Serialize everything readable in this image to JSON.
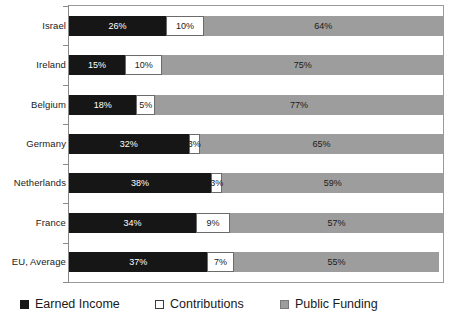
{
  "chart_data": {
    "type": "bar",
    "orientation": "horizontal",
    "stacked": true,
    "title": "",
    "xlabel": "",
    "ylabel": "",
    "xlim": [
      0,
      100
    ],
    "grid": false,
    "legend_position": "bottom",
    "categories": [
      "Israel",
      "Ireland",
      "Belgium",
      "Germany",
      "Netherlands",
      "France",
      "EU, Average"
    ],
    "series": [
      {
        "name": "Earned Income",
        "color": "#161616",
        "values": [
          26,
          15,
          18,
          32,
          38,
          34,
          37
        ],
        "labels": [
          "26%",
          "15%",
          "18%",
          "32%",
          "38%",
          "34%",
          "37%"
        ]
      },
      {
        "name": "Contributions",
        "color": "#ffffff",
        "values": [
          10,
          10,
          5,
          3,
          3,
          9,
          7
        ],
        "labels": [
          "10%",
          "10%",
          "5%",
          "3%",
          "3%",
          "9%",
          "7%"
        ]
      },
      {
        "name": "Public Funding",
        "color": "#9d9d9d",
        "values": [
          64,
          75,
          77,
          65,
          59,
          57,
          55
        ],
        "labels": [
          "64%",
          "75%",
          "77%",
          "65%",
          "59%",
          "57%",
          "55%"
        ]
      }
    ]
  },
  "legend": {
    "items": [
      {
        "label": "Earned Income",
        "swatch": "legend-swatch-earned-income"
      },
      {
        "label": "Contributions",
        "swatch": "legend-swatch-contributions"
      },
      {
        "label": "Public Funding",
        "swatch": "legend-swatch-public-funding"
      }
    ]
  }
}
